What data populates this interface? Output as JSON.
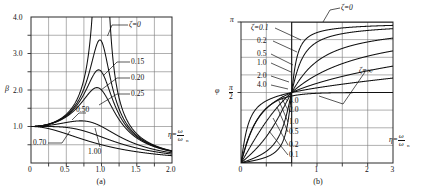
{
  "figure": {
    "panels": [
      {
        "id": "a",
        "caption": "(a)",
        "ylabel": "β",
        "xlabel_eta": "η=",
        "xlabel_num": "ω",
        "xlabel_den": "ω",
        "xlabel_den_sub": "n",
        "xticks": [
          "0",
          "0.5",
          "1.0",
          "1.5",
          "2.0"
        ],
        "yticks": [
          "1.0",
          "2.0",
          "3.0",
          "4.0"
        ],
        "curve_labels": [
          "ζ=0",
          "0.15",
          "0.20",
          "0.25",
          "0.50",
          "0.70",
          "1.00"
        ]
      },
      {
        "id": "b",
        "caption": "(b)",
        "ylabel": "φ",
        "xlabel_eta": "η=",
        "xlabel_num": "ω",
        "xlabel_den": "ω",
        "xlabel_den_sub": "n",
        "xticks": [
          "0",
          "1",
          "2",
          "3"
        ],
        "ytick_top": "π",
        "ytick_mid_num": "π",
        "ytick_mid_den": "2",
        "curve_labels_top": [
          "ζ=0",
          "ζ=0.1",
          "0.2",
          "0.5",
          "1.0",
          "2.0",
          "4.0"
        ],
        "curve_labels_bottom": [
          "4.0",
          "2.0",
          "1.0",
          "0.5",
          "0.2",
          "0.1",
          "ζ=∞"
        ]
      }
    ]
  },
  "chart_data": [
    {
      "type": "line",
      "id": "a",
      "title": "(a)",
      "xlabel": "η = ω/ωn",
      "ylabel": "β",
      "xlim": [
        0,
        2.0
      ],
      "ylim": [
        0,
        4.0
      ],
      "grid": true,
      "xticks": [
        0,
        0.5,
        1.0,
        1.5,
        2.0
      ],
      "yticks": [
        1.0,
        2.0,
        3.0,
        4.0
      ],
      "description": "Magnification factor beta versus frequency ratio eta for damping ratios zeta",
      "series": [
        {
          "name": "ζ=0",
          "zeta": 0.0,
          "peak": null
        },
        {
          "name": "0.15",
          "zeta": 0.15,
          "peak": 3.38
        },
        {
          "name": "0.20",
          "zeta": 0.2,
          "peak": 2.55
        },
        {
          "name": "0.25",
          "zeta": 0.25,
          "peak": 2.07
        },
        {
          "name": "0.50",
          "zeta": 0.5,
          "peak": 1.15
        },
        {
          "name": "0.70",
          "zeta": 0.7,
          "peak": 1.0
        },
        {
          "name": "1.00",
          "zeta": 1.0,
          "peak": 1.0
        }
      ],
      "formula": "beta = 1 / sqrt((1-eta^2)^2 + (2*zeta*eta)^2)"
    },
    {
      "type": "line",
      "id": "b",
      "title": "(b)",
      "xlabel": "η = ω/ωn",
      "ylabel": "φ",
      "xlim": [
        0,
        3
      ],
      "ylim": [
        0,
        3.14159
      ],
      "grid": true,
      "xticks": [
        0,
        1,
        2,
        3
      ],
      "yticks": [
        "0",
        "π/2",
        "π"
      ],
      "description": "Phase angle phi versus frequency ratio eta for damping ratios zeta",
      "series": [
        {
          "name": "ζ=0",
          "zeta": 0.0
        },
        {
          "name": "0.1",
          "zeta": 0.1
        },
        {
          "name": "0.2",
          "zeta": 0.2
        },
        {
          "name": "0.5",
          "zeta": 0.5
        },
        {
          "name": "1.0",
          "zeta": 1.0
        },
        {
          "name": "2.0",
          "zeta": 2.0
        },
        {
          "name": "4.0",
          "zeta": 4.0
        },
        {
          "name": "ζ=∞",
          "zeta": null
        }
      ],
      "formula": "phi = atan2(2*zeta*eta, 1-eta^2)"
    }
  ]
}
